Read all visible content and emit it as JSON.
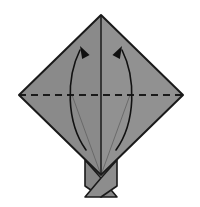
{
  "figure": {
    "title": "Origami fold step diagram",
    "canvas": {
      "width": 200,
      "height": 207,
      "background": "#ffffff"
    }
  },
  "colors": {
    "paper_left": "#8a8a8a",
    "paper_right": "#919191",
    "flap_left": "#868686",
    "flap_right": "#8d8d8d",
    "outline": "#1a1a1a",
    "crease_solid": "#1a1a1a",
    "crease_dashed": "#1a1a1a",
    "arrow": "#111111",
    "background": "#ffffff"
  },
  "geometry": {
    "diamond": {
      "name": "diamond-paper",
      "top": [
        101,
        15
      ],
      "left": [
        19,
        95
      ],
      "right": [
        183,
        95
      ],
      "bottom": [
        101,
        175
      ]
    },
    "center_crease": {
      "name": "vertical-center-crease",
      "x": 101,
      "y1": 15,
      "y2": 175
    },
    "fold_line": {
      "name": "horizontal-dashed-fold",
      "y": 95,
      "x1": 19,
      "x2": 183,
      "style": "dashed",
      "dash": "7 5"
    },
    "flaps": {
      "left": {
        "name": "flap-left",
        "points": "85,160 101,178 117,197 101,197 85,186"
      },
      "right": {
        "name": "flap-right",
        "points": "117,160 101,178 85,197 101,197 117,186"
      }
    },
    "inner_creases": [
      {
        "name": "inner-crease-left",
        "points": "72,95 101,175"
      },
      {
        "name": "inner-crease-right",
        "points": "130,95 101,175"
      }
    ]
  },
  "arrows": {
    "left": {
      "name": "fold-arrow-left",
      "label": "fold lower left edge up",
      "path": "M 86,150 C 66,122 66,78 80,50",
      "head_at": [
        80,
        46
      ],
      "head_angle": -28,
      "direction": "up"
    },
    "right": {
      "name": "fold-arrow-right",
      "label": "fold lower right edge up",
      "path": "M 116,150 C 136,122 136,78 122,50",
      "head_at": [
        122,
        46
      ],
      "head_angle": 28,
      "direction": "up"
    }
  },
  "annotations": {
    "fold_line_meaning": "valley fold",
    "arrow_meaning": "fold in direction of arrow"
  }
}
